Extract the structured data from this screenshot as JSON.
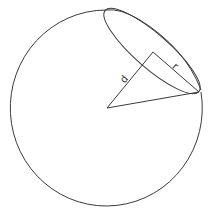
{
  "diagram": {
    "labels": {
      "distance": "d",
      "cap_radius": "r"
    },
    "colors": {
      "stroke": "#3a3a3a",
      "background": "#ffffff"
    }
  }
}
